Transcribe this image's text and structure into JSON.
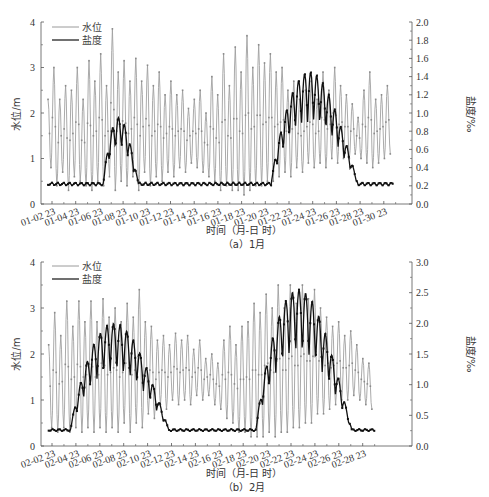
{
  "chart_data": [
    {
      "id": "a",
      "type": "line",
      "caption": "（a）1月",
      "xlabel": "时间（月-日 时）",
      "ylabel_left": "水位/m",
      "ylabel_right": "盐度/‰",
      "ylim_left": [
        0,
        4
      ],
      "ylim_right": [
        0,
        2.0
      ],
      "yticks_left": [
        "0",
        "1",
        "2",
        "3",
        "4"
      ],
      "yticks_right": [
        "0.0",
        "0.2",
        "0.4",
        "0.6",
        "0.8",
        "1.0",
        "1.2",
        "1.4",
        "1.6",
        "1.8",
        "2.0"
      ],
      "xticks": [
        "01-02 23",
        "01-04 23",
        "01-06 23",
        "01-08 23",
        "01-10 23",
        "01-12 23",
        "01-14 23",
        "01-16 23",
        "01-18 23",
        "01-20 23",
        "01-22 23",
        "01-24 23",
        "01-26 23",
        "01-28 23",
        "01-30 23"
      ],
      "legend": [
        {
          "name": "水位",
          "color": "#9a9a9a"
        },
        {
          "name": "盐度",
          "color": "#111111"
        }
      ],
      "grid": false,
      "series": [
        {
          "name": "水位",
          "axis": "left",
          "description": "semi-diurnal tidal oscillation",
          "day_start": 1.8,
          "day_end": 31.2,
          "peaks_high": [
            2.3,
            3.0,
            2.3,
            2.6,
            2.5,
            3.0,
            2.3,
            3.15,
            2.7,
            3.3,
            2.6,
            3.85,
            2.9,
            3.15,
            2.7,
            3.2,
            2.7,
            3.05,
            2.6,
            2.9,
            2.4,
            2.7,
            2.4,
            2.5,
            2.1,
            2.3,
            2.5,
            2.0,
            2.8,
            2.4,
            3.3,
            2.6,
            3.45,
            2.9,
            3.7,
            3.0,
            3.5,
            3.1,
            3.3,
            2.9,
            3.0,
            2.5,
            2.7,
            2.3,
            2.5,
            2.7,
            2.3,
            2.9,
            2.5,
            3.0,
            2.6,
            2.4,
            2.2,
            1.9,
            2.5,
            2.9,
            2.3,
            2.4,
            2.6
          ],
          "troughs_low": [
            0.8,
            0.4,
            0.7,
            0.3,
            0.6,
            0.5,
            0.4,
            0.3,
            0.5,
            0.4,
            0.6,
            0.3,
            0.5,
            0.4,
            0.6,
            0.3,
            0.7,
            0.4,
            0.6,
            0.5,
            0.7,
            0.6,
            0.8,
            0.7,
            0.9,
            0.8,
            0.7,
            0.6,
            0.5,
            0.3,
            0.4,
            0.3,
            0.3,
            0.2,
            0.3,
            0.4,
            0.4,
            0.5,
            0.5,
            0.6,
            0.7,
            0.6,
            0.8,
            0.7,
            0.9,
            0.8,
            0.9,
            0.8,
            1.0,
            0.9,
            1.0,
            1.0,
            1.1,
            1.0,
            0.9,
            0.8,
            0.9,
            1.0,
            1.1
          ]
        },
        {
          "name": "盐度",
          "axis": "right",
          "description": "baseline ~0.22‰ with spikes Jan 6-9 up to ~0.95‰ and a main intrusion Jan 21-28 peaking ~1.45‰",
          "baseline": 0.22,
          "events": [
            {
              "start_day": 6.5,
              "end_day": 9.5,
              "peak": 0.95
            },
            {
              "start_day": 20.8,
              "end_day": 28.2,
              "peak": 1.45
            }
          ]
        }
      ]
    },
    {
      "id": "b",
      "type": "line",
      "caption": "（b）2月",
      "xlabel": "时间（月-日 时）",
      "ylabel_left": "水位/m",
      "ylabel_right": "盐度/‰",
      "ylim_left": [
        0,
        4
      ],
      "ylim_right": [
        0,
        3.0
      ],
      "yticks_left": [
        "0",
        "1",
        "2",
        "3",
        "4"
      ],
      "yticks_right": [
        "0.0",
        "0.5",
        "1.0",
        "1.5",
        "2.0",
        "2.5",
        "3.0"
      ],
      "xticks": [
        "02-02 23",
        "02-04 23",
        "02-06 23",
        "02-08 23",
        "02-10 23",
        "02-12 23",
        "02-14 23",
        "02-16 23",
        "02-18 23",
        "02-20 23",
        "02-22 23",
        "02-24 23",
        "02-26 23",
        "02-28 23"
      ],
      "legend": [
        {
          "name": "水位",
          "color": "#9a9a9a"
        },
        {
          "name": "盐度",
          "color": "#111111"
        }
      ],
      "grid": false,
      "series": [
        {
          "name": "水位",
          "axis": "left",
          "description": "semi-diurnal tidal oscillation",
          "day_start": 1.8,
          "day_end": 27.3,
          "peaks_high": [
            2.2,
            2.9,
            2.4,
            3.15,
            2.6,
            3.15,
            2.7,
            3.15,
            2.7,
            3.2,
            2.8,
            3.0,
            2.7,
            3.1,
            2.8,
            3.4,
            2.7,
            2.6,
            2.3,
            2.4,
            2.2,
            2.45,
            2.3,
            2.4,
            2.1,
            2.3,
            1.9,
            2.0,
            1.8,
            2.3,
            2.6,
            2.2,
            2.6,
            2.7,
            3.1,
            2.9,
            3.3,
            3.0,
            3.5,
            3.0,
            3.5,
            3.1,
            3.5,
            3.2,
            3.4,
            3.0,
            2.8,
            2.6,
            2.7,
            2.4,
            2.5,
            2.2,
            1.9,
            1.8
          ],
          "troughs_low": [
            0.4,
            0.3,
            0.4,
            0.3,
            0.4,
            0.3,
            0.4,
            0.3,
            0.4,
            0.3,
            0.4,
            0.3,
            0.5,
            0.3,
            0.5,
            0.4,
            0.7,
            0.6,
            0.9,
            0.8,
            1.0,
            0.9,
            1.0,
            0.9,
            1.1,
            1.0,
            1.1,
            0.9,
            0.8,
            0.6,
            0.5,
            0.3,
            0.3,
            0.2,
            0.2,
            0.2,
            0.3,
            0.2,
            0.3,
            0.3,
            0.4,
            0.4,
            0.5,
            0.5,
            0.7,
            0.7,
            0.8,
            0.9,
            1.0,
            1.0,
            1.1,
            1.0,
            0.9,
            0.8
          ]
        },
        {
          "name": "盐度",
          "axis": "right",
          "description": "baseline ~0.25‰; oscillating intrusion Feb 3-11 peaking ~2.0‰, main intrusion Feb 18-25 peaking ~2.55‰, decays to ~0.3‰ by Feb 28",
          "baseline": 0.26,
          "events": [
            {
              "start_day": 3.5,
              "end_day": 11.2,
              "peak": 2.0
            },
            {
              "start_day": 18.0,
              "end_day": 25.5,
              "peak": 2.55
            }
          ]
        }
      ]
    }
  ]
}
